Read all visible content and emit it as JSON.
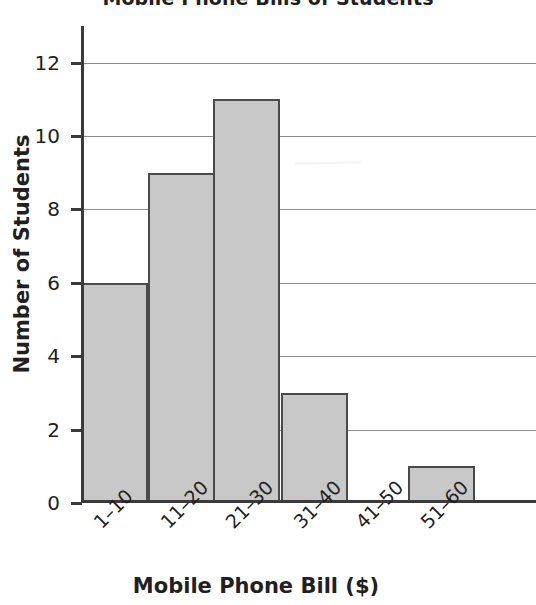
{
  "chart_data": {
    "type": "bar",
    "title": "Mobile Phone Bills of Students",
    "xlabel": "Mobile Phone Bill ($)",
    "ylabel": "Number of Students",
    "categories": [
      "1–10",
      "11–20",
      "21–30",
      "31–40",
      "41–50",
      "51–60"
    ],
    "values": [
      6,
      9,
      11,
      3,
      0,
      1
    ],
    "ylim": [
      0,
      13
    ],
    "yticks": [
      0,
      2,
      4,
      6,
      8,
      10,
      12
    ],
    "ytick_labels": [
      "0",
      "2",
      "4",
      "6",
      "8",
      "10",
      "12"
    ],
    "grid": "horizontal",
    "legend": "none",
    "bar_fill_color": "#c8c8c8",
    "bar_edge_color": "#4a4a4a",
    "gridline_color": "#8d8d8d",
    "axis_color": "#3a3a3a",
    "text_color": "#231f20",
    "background_color": "#ffffff"
  }
}
